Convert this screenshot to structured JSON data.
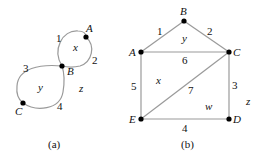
{
  "graph_a": {
    "caption": "(a)",
    "vertices": [
      {
        "id": "A",
        "label": "A",
        "x": 86,
        "y": 37
      },
      {
        "id": "B",
        "label": "B",
        "x": 62,
        "y": 66
      },
      {
        "id": "C",
        "label": "C",
        "x": 23,
        "y": 103
      }
    ],
    "edges": [
      {
        "label": "1"
      },
      {
        "label": "2"
      },
      {
        "label": "3"
      },
      {
        "label": "4"
      }
    ],
    "faces": [
      {
        "label": "x"
      },
      {
        "label": "y"
      },
      {
        "label": "z"
      }
    ]
  },
  "graph_b": {
    "caption": "(b)",
    "vertices": [
      {
        "id": "A",
        "label": "A",
        "x": 141,
        "y": 52
      },
      {
        "id": "B",
        "label": "B",
        "x": 184,
        "y": 21
      },
      {
        "id": "C",
        "label": "C",
        "x": 229,
        "y": 52
      },
      {
        "id": "D",
        "label": "D",
        "x": 229,
        "y": 119
      },
      {
        "id": "E",
        "label": "E",
        "x": 141,
        "y": 119
      }
    ],
    "edges": [
      {
        "label": "1",
        "from": "A",
        "to": "B"
      },
      {
        "label": "2",
        "from": "B",
        "to": "C"
      },
      {
        "label": "3",
        "from": "C",
        "to": "D"
      },
      {
        "label": "4",
        "from": "E",
        "to": "D"
      },
      {
        "label": "5",
        "from": "A",
        "to": "E"
      },
      {
        "label": "6",
        "from": "A",
        "to": "C"
      },
      {
        "label": "7",
        "from": "E",
        "to": "C"
      }
    ],
    "faces": [
      {
        "label": "y"
      },
      {
        "label": "x"
      },
      {
        "label": "w"
      },
      {
        "label": "z"
      }
    ]
  }
}
